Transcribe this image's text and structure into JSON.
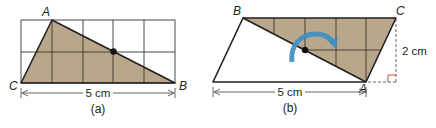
{
  "colors": {
    "shade": "#b8a78a",
    "line": "#231f20",
    "grid": "#3a3530",
    "arrow": "#3f8fc4",
    "background": "#ffffff"
  },
  "figure_a": {
    "caption": "(a)",
    "vertices": {
      "A": "A",
      "B": "B",
      "C": "C"
    },
    "dimension_label": "5 cm",
    "grid": {
      "columns": 5,
      "rows": 2
    },
    "shape": "triangle"
  },
  "figure_b": {
    "caption": "(b)",
    "vertices": {
      "A": "A",
      "B": "B",
      "C": "C"
    },
    "base_label": "5 cm",
    "height_label": "2 cm",
    "shape": "parallelogram",
    "rotation_arrow": "rotate-clockwise"
  }
}
